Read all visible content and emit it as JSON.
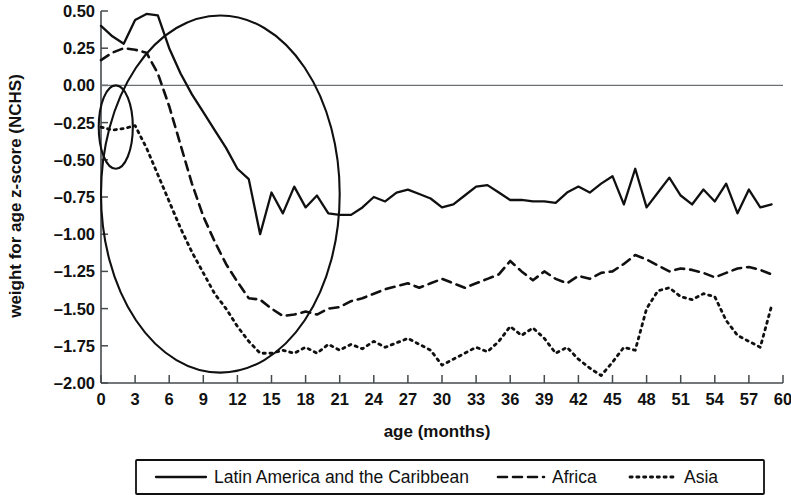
{
  "chart_data": {
    "type": "line",
    "title": "",
    "xlabel": "age (months)",
    "ylabel": "weight for age z-score (NCHS)",
    "xlim": [
      0,
      60
    ],
    "ylim": [
      -2.0,
      0.5
    ],
    "xticks": [
      0,
      3,
      6,
      9,
      12,
      15,
      18,
      21,
      24,
      27,
      30,
      33,
      36,
      39,
      42,
      45,
      48,
      51,
      54,
      57,
      60
    ],
    "xtick_labels": [
      "0",
      "3",
      "6",
      "9",
      "12",
      "15",
      "18",
      "21",
      "24",
      "27",
      "30",
      "33",
      "36",
      "39",
      "42",
      "45",
      "48",
      "51",
      "54",
      "57",
      "60"
    ],
    "yticks": [
      0.5,
      0.25,
      0,
      -0.25,
      -0.5,
      -0.75,
      -1.0,
      -1.25,
      -1.5,
      -1.75,
      -2.0
    ],
    "ytick_labels": [
      "0.50",
      "0.25",
      "0.00",
      "-0.25",
      "-0.50",
      "-0.75",
      "-1.00",
      "-1.25",
      "-1.50",
      "-1.75",
      "-2.00"
    ],
    "grid": false,
    "zero_reference_line": 0,
    "legend_position": "bottom",
    "series": [
      {
        "name": "Latin America and the Caribbean",
        "style": "solid",
        "color": "#101010",
        "x": [
          0,
          1,
          2,
          3,
          4,
          5,
          6,
          7,
          8,
          9,
          10,
          11,
          12,
          13,
          14,
          15,
          16,
          17,
          18,
          19,
          20,
          21,
          22,
          23,
          24,
          25,
          26,
          27,
          28,
          29,
          30,
          31,
          32,
          33,
          34,
          35,
          36,
          37,
          38,
          39,
          40,
          41,
          42,
          43,
          44,
          45,
          46,
          47,
          48,
          49,
          50,
          51,
          52,
          53,
          54,
          55,
          56,
          57,
          58,
          59
        ],
        "y": [
          0.4,
          0.33,
          0.28,
          0.44,
          0.48,
          0.47,
          0.25,
          0.08,
          -0.06,
          -0.18,
          -0.3,
          -0.42,
          -0.56,
          -0.63,
          -1.0,
          -0.72,
          -0.86,
          -0.68,
          -0.82,
          -0.74,
          -0.86,
          -0.87,
          -0.87,
          -0.82,
          -0.75,
          -0.78,
          -0.72,
          -0.7,
          -0.73,
          -0.76,
          -0.82,
          -0.8,
          -0.74,
          -0.68,
          -0.67,
          -0.72,
          -0.77,
          -0.77,
          -0.78,
          -0.78,
          -0.79,
          -0.72,
          -0.68,
          -0.72,
          -0.66,
          -0.61,
          -0.8,
          -0.56,
          -0.82,
          -0.72,
          -0.62,
          -0.74,
          -0.8,
          -0.7,
          -0.78,
          -0.66,
          -0.86,
          -0.7,
          -0.82,
          -0.8
        ]
      },
      {
        "name": "Africa",
        "style": "dashed",
        "color": "#101010",
        "x": [
          0,
          1,
          2,
          3,
          4,
          5,
          6,
          7,
          8,
          9,
          10,
          11,
          12,
          13,
          14,
          15,
          16,
          17,
          18,
          19,
          20,
          21,
          22,
          23,
          24,
          25,
          26,
          27,
          28,
          29,
          30,
          31,
          32,
          33,
          34,
          35,
          36,
          37,
          38,
          39,
          40,
          41,
          42,
          43,
          44,
          45,
          46,
          47,
          48,
          49,
          50,
          51,
          52,
          53,
          54,
          55,
          56,
          57,
          58,
          59
        ],
        "y": [
          0.17,
          0.22,
          0.25,
          0.24,
          0.22,
          0.08,
          -0.14,
          -0.4,
          -0.66,
          -0.88,
          -1.05,
          -1.2,
          -1.32,
          -1.43,
          -1.44,
          -1.5,
          -1.55,
          -1.54,
          -1.52,
          -1.54,
          -1.5,
          -1.49,
          -1.45,
          -1.43,
          -1.4,
          -1.37,
          -1.35,
          -1.33,
          -1.36,
          -1.33,
          -1.3,
          -1.33,
          -1.36,
          -1.33,
          -1.3,
          -1.27,
          -1.18,
          -1.25,
          -1.31,
          -1.25,
          -1.3,
          -1.33,
          -1.28,
          -1.3,
          -1.26,
          -1.25,
          -1.2,
          -1.14,
          -1.17,
          -1.21,
          -1.25,
          -1.23,
          -1.24,
          -1.26,
          -1.29,
          -1.26,
          -1.23,
          -1.22,
          -1.24,
          -1.27
        ]
      },
      {
        "name": "Asia",
        "style": "dotted",
        "color": "#101010",
        "x": [
          0,
          1,
          2,
          3,
          4,
          5,
          6,
          7,
          8,
          9,
          10,
          11,
          12,
          13,
          14,
          15,
          16,
          17,
          18,
          19,
          20,
          21,
          22,
          23,
          24,
          25,
          26,
          27,
          28,
          29,
          30,
          31,
          32,
          33,
          34,
          35,
          36,
          37,
          38,
          39,
          40,
          41,
          42,
          43,
          44,
          45,
          46,
          47,
          48,
          49,
          50,
          51,
          52,
          53,
          54,
          55,
          56,
          57,
          58,
          59
        ],
        "y": [
          -0.28,
          -0.3,
          -0.29,
          -0.27,
          -0.42,
          -0.6,
          -0.78,
          -0.96,
          -1.12,
          -1.26,
          -1.4,
          -1.5,
          -1.62,
          -1.72,
          -1.8,
          -1.8,
          -1.78,
          -1.8,
          -1.76,
          -1.8,
          -1.74,
          -1.78,
          -1.74,
          -1.77,
          -1.72,
          -1.76,
          -1.73,
          -1.7,
          -1.74,
          -1.78,
          -1.88,
          -1.84,
          -1.8,
          -1.76,
          -1.79,
          -1.72,
          -1.62,
          -1.68,
          -1.63,
          -1.7,
          -1.8,
          -1.76,
          -1.84,
          -1.9,
          -1.95,
          -1.86,
          -1.76,
          -1.78,
          -1.5,
          -1.38,
          -1.36,
          -1.42,
          -1.44,
          -1.4,
          -1.42,
          -1.58,
          -1.68,
          -1.72,
          -1.76,
          -1.48
        ]
      }
    ],
    "annotations": [
      {
        "name": "large-highlight-ellipse",
        "shape": "ellipse",
        "cx_months": 10.5,
        "cy_value": -0.73,
        "rx_months": 10.5,
        "ry_value": 1.2
      },
      {
        "name": "small-highlight-ellipse",
        "shape": "ellipse",
        "cx_months": 1.3,
        "cy_value": -0.28,
        "rx_months": 1.5,
        "ry_value": 0.28
      }
    ]
  },
  "legend": {
    "items": [
      {
        "label": "Latin America and the Caribbean",
        "style": "solid"
      },
      {
        "label": "Africa",
        "style": "dashed"
      },
      {
        "label": "Asia",
        "style": "dotted"
      }
    ]
  }
}
